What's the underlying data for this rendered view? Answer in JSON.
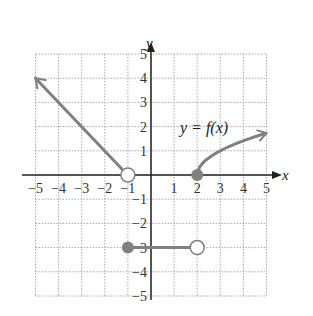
{
  "chart_data": {
    "type": "line",
    "title": "",
    "xlabel": "x",
    "ylabel": "y",
    "xlim": [
      -5,
      5
    ],
    "ylim": [
      -5,
      5
    ],
    "grid": true,
    "x_ticks": [
      "−5",
      "−4",
      "−3",
      "−2",
      "−1",
      "1",
      "2",
      "3",
      "4",
      "5"
    ],
    "y_ticks": [
      "5",
      "4",
      "3",
      "2",
      "1",
      "−1",
      "−2",
      "−3",
      "−4",
      "−5"
    ],
    "annotation": "y = f(x)",
    "series": [
      {
        "name": "linear piece",
        "points": [
          [
            -5,
            4
          ],
          [
            -1,
            0
          ]
        ],
        "left_end": "arrow",
        "right_end": "open"
      },
      {
        "name": "constant piece",
        "points": [
          [
            -1,
            -3
          ],
          [
            2,
            -3
          ]
        ],
        "left_end": "closed",
        "right_end": "open"
      },
      {
        "name": "sqrt piece",
        "points": [
          [
            2,
            0
          ],
          [
            3,
            1
          ],
          [
            5,
            1.73
          ]
        ],
        "left_end": "closed",
        "right_end": "arrow"
      }
    ],
    "colors": {
      "curve": "#808080",
      "axis": "#222222",
      "grid": "#aaaaaa"
    }
  }
}
